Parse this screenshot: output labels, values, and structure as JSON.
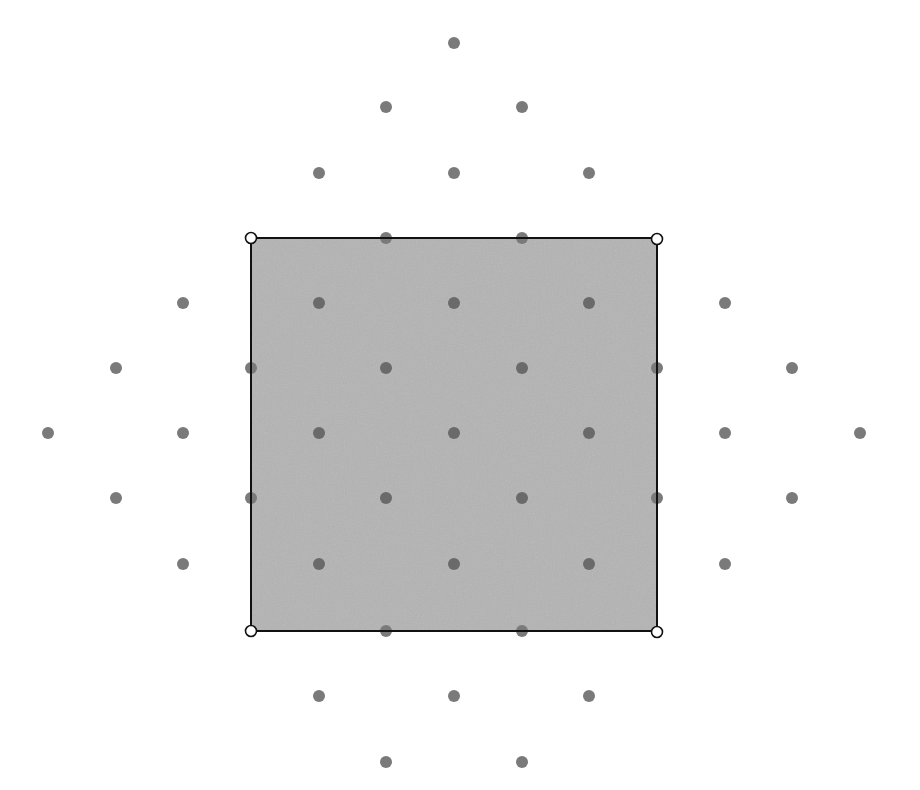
{
  "diagram": {
    "colors": {
      "background": "#ffffff",
      "square_fill": "#b4b4b4",
      "square_stroke": "#111111",
      "dot": "#7a7a7a",
      "dot_inside": "#6a6a6a",
      "corner_fill": "#ffffff",
      "corner_stroke": "#111111"
    },
    "grid": {
      "xs": [
        48,
        116,
        183,
        251,
        319,
        386,
        454,
        522,
        589,
        657,
        725,
        792,
        860
      ],
      "ys": [
        43,
        107,
        173,
        238,
        303,
        368,
        433,
        498,
        564,
        631,
        696,
        762
      ]
    },
    "square": {
      "x1": 251,
      "y1": 238,
      "x2": 657,
      "y2": 631
    },
    "corners": [
      {
        "x": 251,
        "y": 238
      },
      {
        "x": 657,
        "y": 239
      },
      {
        "x": 251,
        "y": 631
      },
      {
        "x": 657,
        "y": 632
      }
    ],
    "dots": [
      {
        "x": 454,
        "y": 43
      },
      {
        "x": 386,
        "y": 107
      },
      {
        "x": 522,
        "y": 107
      },
      {
        "x": 319,
        "y": 173
      },
      {
        "x": 454,
        "y": 173
      },
      {
        "x": 589,
        "y": 173
      },
      {
        "x": 386,
        "y": 238
      },
      {
        "x": 522,
        "y": 238
      },
      {
        "x": 183,
        "y": 303
      },
      {
        "x": 319,
        "y": 303
      },
      {
        "x": 454,
        "y": 303
      },
      {
        "x": 589,
        "y": 303
      },
      {
        "x": 725,
        "y": 303
      },
      {
        "x": 116,
        "y": 368
      },
      {
        "x": 251,
        "y": 368
      },
      {
        "x": 386,
        "y": 368
      },
      {
        "x": 522,
        "y": 368
      },
      {
        "x": 657,
        "y": 368
      },
      {
        "x": 792,
        "y": 368
      },
      {
        "x": 48,
        "y": 433
      },
      {
        "x": 183,
        "y": 433
      },
      {
        "x": 319,
        "y": 433
      },
      {
        "x": 454,
        "y": 433
      },
      {
        "x": 589,
        "y": 433
      },
      {
        "x": 725,
        "y": 433
      },
      {
        "x": 860,
        "y": 433
      },
      {
        "x": 116,
        "y": 498
      },
      {
        "x": 251,
        "y": 498
      },
      {
        "x": 386,
        "y": 498
      },
      {
        "x": 522,
        "y": 498
      },
      {
        "x": 657,
        "y": 498
      },
      {
        "x": 792,
        "y": 498
      },
      {
        "x": 183,
        "y": 564
      },
      {
        "x": 319,
        "y": 564
      },
      {
        "x": 454,
        "y": 564
      },
      {
        "x": 589,
        "y": 564
      },
      {
        "x": 725,
        "y": 564
      },
      {
        "x": 386,
        "y": 631
      },
      {
        "x": 522,
        "y": 631
      },
      {
        "x": 319,
        "y": 696
      },
      {
        "x": 454,
        "y": 696
      },
      {
        "x": 589,
        "y": 696
      },
      {
        "x": 386,
        "y": 762
      },
      {
        "x": 522,
        "y": 762
      }
    ],
    "dot_radius": 6,
    "corner_radius": 5.5
  }
}
